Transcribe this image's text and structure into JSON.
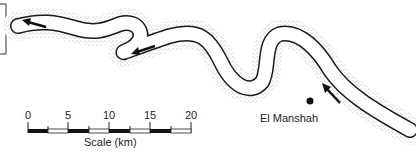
{
  "map": {
    "place_label": "El Manshah",
    "scale": {
      "title": "Scale (km)",
      "ticks": [
        "0",
        "5",
        "10",
        "15",
        "20"
      ]
    },
    "colors": {
      "river_bank": "#1a1a1a",
      "stipple": "#555555",
      "background": "#ffffff"
    },
    "flow_arrows": 3
  }
}
